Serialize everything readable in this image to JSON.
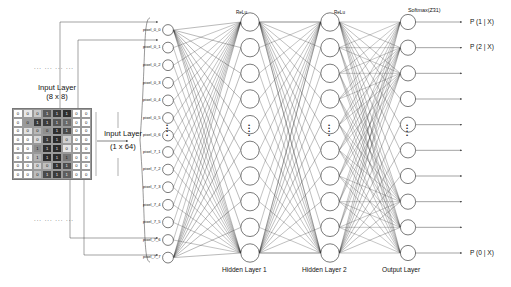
{
  "diagram": {
    "title_input_8x8": "Input Layer",
    "subtitle_input_8x8": "(8 x 8)",
    "title_input_1x64": "Input Layer",
    "subtitle_input_1x64": "(1 x 64)",
    "dots_top": "... ... ... ...",
    "dots_bottom": "... ... ... ...",
    "vertical_ellipsis": "⋮"
  },
  "layers": {
    "input_labels_top": [
      "pixel_0_0",
      "pixel_0_1",
      "pixel_0_2",
      "pixel_0_3",
      "pixel_0_4",
      "pixel_0_5",
      "pixel_0_6"
    ],
    "input_labels_bottom": [
      "pixel_7_1",
      "pixel_7_2",
      "pixel_7_3",
      "pixel_7_4",
      "pixel_7_5",
      "pixel_7_6",
      "pixel_7_7"
    ],
    "hidden1": {
      "caption": "Hidden Layer 1",
      "activation": "ReLu",
      "node_count": 10
    },
    "hidden2": {
      "caption": "Hidden Layer 2",
      "activation": "ReLu",
      "node_count": 10
    },
    "output": {
      "caption": "Output Layer",
      "activation": "Softmax(Z31)",
      "node_count": 10,
      "labels": [
        "P (1 | X)",
        "P (2 | X)",
        "",
        "",
        "",
        "",
        "",
        "",
        "",
        "P (0 | X)"
      ]
    }
  },
  "pixel_grid": {
    "rows": 8,
    "cols": 8,
    "values": [
      [
        0,
        0,
        0,
        1,
        1,
        1,
        0,
        0
      ],
      [
        0,
        0,
        1,
        1,
        1,
        1,
        0,
        0
      ],
      [
        0,
        0,
        0,
        0,
        1,
        1,
        0,
        0
      ],
      [
        0,
        0,
        0,
        1,
        1,
        0,
        0,
        0
      ],
      [
        0,
        0,
        1,
        1,
        1,
        0,
        0,
        0
      ],
      [
        0,
        0,
        1,
        1,
        1,
        1,
        0,
        0
      ],
      [
        0,
        0,
        0,
        0,
        1,
        1,
        0,
        0
      ],
      [
        0,
        0,
        0,
        1,
        1,
        1,
        0,
        0
      ]
    ],
    "shades": [
      [
        "#ffffff",
        "#e8e8e8",
        "#c9c9c9",
        "#5a5a5a",
        "#3a3a3a",
        "#2e2e2e",
        "#ffffff",
        "#ffffff"
      ],
      [
        "#ffffff",
        "#9a9a9a",
        "#3b3b3b",
        "#3b3b3b",
        "#555555",
        "#6a6a6a",
        "#ffffff",
        "#ffffff"
      ],
      [
        "#ffffff",
        "#e2e2e2",
        "#b8b8b8",
        "#8f8f8f",
        "#2f2f2f",
        "#4a4a4a",
        "#ffffff",
        "#ffffff"
      ],
      [
        "#ffffff",
        "#ffffff",
        "#d8d8d8",
        "#3a3a3a",
        "#2b2b2b",
        "#d0d0d0",
        "#ffffff",
        "#ffffff"
      ],
      [
        "#ffffff",
        "#ffffff",
        "#8d8d8d",
        "#303030",
        "#2a2a2a",
        "#e6e6e6",
        "#ffffff",
        "#ffffff"
      ],
      [
        "#ffffff",
        "#ffffff",
        "#b4b4b4",
        "#2d2d2d",
        "#2d2d2d",
        "#777777",
        "#ffffff",
        "#ffffff"
      ],
      [
        "#ffffff",
        "#ffffff",
        "#d4d4d4",
        "#c0c0c0",
        "#333333",
        "#4d4d4d",
        "#ffffff",
        "#ffffff"
      ],
      [
        "#ffffff",
        "#ffffff",
        "#bdbdbd",
        "#4a4a4a",
        "#3c3c3c",
        "#5e5e5e",
        "#ffffff",
        "#ffffff"
      ]
    ]
  },
  "style": {
    "stroke": "#333333",
    "node_fill": "#ffffff",
    "node_stroke": "#222222"
  }
}
